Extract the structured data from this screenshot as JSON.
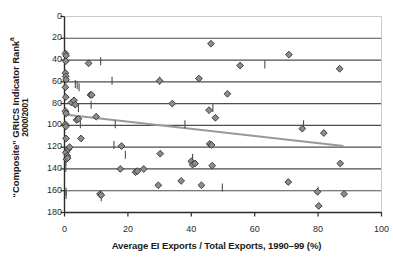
{
  "chart_data": {
    "type": "scatter",
    "title": "",
    "xlabel": "Average EI Exports / Total Exports, 1990–99 (%)",
    "ylabel_line1": "“Composite” GRICS Indicator Rank",
    "ylabel_superscript": "a",
    "ylabel_line2": "2000/2001",
    "xlim": [
      0,
      100
    ],
    "ylim": [
      0,
      180
    ],
    "y_inverted": true,
    "xticks": [
      0,
      20,
      40,
      60,
      80,
      100
    ],
    "yticks": [
      0,
      20,
      40,
      60,
      80,
      100,
      120,
      140,
      160,
      180
    ],
    "grid": "horizontal",
    "legend": "none",
    "marker": "diamond",
    "marker_fill": "#8c8c8c",
    "marker_edge": "#333333",
    "gridline_color": "#4d4d4d",
    "trendline_color": "#999999",
    "points": [
      {
        "x": 0.3,
        "y": 34
      },
      {
        "x": 0.5,
        "y": 36
      },
      {
        "x": 0.4,
        "y": 41
      },
      {
        "x": 0.3,
        "y": 52
      },
      {
        "x": 0.4,
        "y": 55
      },
      {
        "x": 0.5,
        "y": 58
      },
      {
        "x": 0.3,
        "y": 65
      },
      {
        "x": 0.4,
        "y": 74
      },
      {
        "x": 0.3,
        "y": 87
      },
      {
        "x": 0.5,
        "y": 89
      },
      {
        "x": 0.3,
        "y": 99
      },
      {
        "x": 0.4,
        "y": 101
      },
      {
        "x": 0.5,
        "y": 112
      },
      {
        "x": 0.4,
        "y": 125
      },
      {
        "x": 1.2,
        "y": 122
      },
      {
        "x": 1.6,
        "y": 120
      },
      {
        "x": 0.9,
        "y": 128
      },
      {
        "x": 0.6,
        "y": 131
      },
      {
        "x": 1.0,
        "y": 130
      },
      {
        "x": 2.2,
        "y": 79
      },
      {
        "x": 3.0,
        "y": 77
      },
      {
        "x": 3.4,
        "y": 81
      },
      {
        "x": 3.8,
        "y": 95
      },
      {
        "x": 4.4,
        "y": 94
      },
      {
        "x": 5.2,
        "y": 112
      },
      {
        "x": 7.6,
        "y": 43
      },
      {
        "x": 8.2,
        "y": 72
      },
      {
        "x": 8.6,
        "y": 72
      },
      {
        "x": 10.0,
        "y": 92
      },
      {
        "x": 11.2,
        "y": 163
      },
      {
        "x": 11.6,
        "y": 164
      },
      {
        "x": 17.6,
        "y": 140
      },
      {
        "x": 18.0,
        "y": 119
      },
      {
        "x": 22.4,
        "y": 143
      },
      {
        "x": 23.0,
        "y": 142
      },
      {
        "x": 25.0,
        "y": 140
      },
      {
        "x": 29.6,
        "y": 155
      },
      {
        "x": 30.0,
        "y": 59
      },
      {
        "x": 30.2,
        "y": 126
      },
      {
        "x": 34.0,
        "y": 80
      },
      {
        "x": 36.8,
        "y": 151
      },
      {
        "x": 40.0,
        "y": 133
      },
      {
        "x": 40.4,
        "y": 136
      },
      {
        "x": 41.2,
        "y": 135
      },
      {
        "x": 42.4,
        "y": 57
      },
      {
        "x": 43.2,
        "y": 155
      },
      {
        "x": 45.6,
        "y": 86
      },
      {
        "x": 45.8,
        "y": 117
      },
      {
        "x": 46.4,
        "y": 118
      },
      {
        "x": 46.2,
        "y": 25
      },
      {
        "x": 46.6,
        "y": 137
      },
      {
        "x": 47.6,
        "y": 93
      },
      {
        "x": 51.4,
        "y": 71
      },
      {
        "x": 55.4,
        "y": 45
      },
      {
        "x": 70.6,
        "y": 152
      },
      {
        "x": 70.8,
        "y": 35
      },
      {
        "x": 75.0,
        "y": 103
      },
      {
        "x": 79.8,
        "y": 161
      },
      {
        "x": 80.2,
        "y": 174
      },
      {
        "x": 81.8,
        "y": 107
      },
      {
        "x": 86.8,
        "y": 48
      },
      {
        "x": 87.0,
        "y": 135
      },
      {
        "x": 88.2,
        "y": 163
      }
    ],
    "tick_marks": [
      {
        "x": 0.4,
        "y": 133
      },
      {
        "x": 0.4,
        "y": 139
      },
      {
        "x": 0.5,
        "y": 161
      },
      {
        "x": 0.5,
        "y": 164
      },
      {
        "x": 3.4,
        "y": 62
      },
      {
        "x": 4.0,
        "y": 63
      },
      {
        "x": 4.6,
        "y": 65
      },
      {
        "x": 4.4,
        "y": 84
      },
      {
        "x": 5.0,
        "y": 99
      },
      {
        "x": 8.4,
        "y": 81
      },
      {
        "x": 11.4,
        "y": 41
      },
      {
        "x": 11.6,
        "y": 166
      },
      {
        "x": 15.0,
        "y": 59
      },
      {
        "x": 15.6,
        "y": 118
      },
      {
        "x": 16.0,
        "y": 99
      },
      {
        "x": 19.2,
        "y": 127
      },
      {
        "x": 30.0,
        "y": 59
      },
      {
        "x": 38.0,
        "y": 99
      },
      {
        "x": 40.4,
        "y": 130
      },
      {
        "x": 46.8,
        "y": 84
      },
      {
        "x": 49.8,
        "y": 157
      },
      {
        "x": 63.2,
        "y": 44
      },
      {
        "x": 75.4,
        "y": 99
      },
      {
        "x": 80.0,
        "y": 160
      }
    ],
    "trendline": {
      "x1": 0,
      "y1": 90,
      "x2": 88,
      "y2": 119
    }
  }
}
